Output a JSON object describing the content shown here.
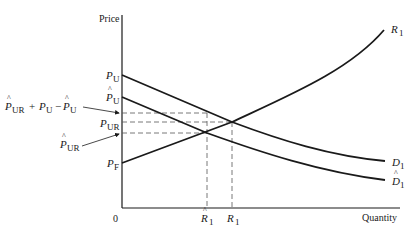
{
  "diagram": {
    "axes": {
      "y_label": "Price",
      "x_label": "Quantity",
      "origin_label": "0"
    },
    "price_labels": {
      "p_u": {
        "main": "P",
        "sub": "U",
        "hat": false
      },
      "p_u_hat": {
        "main": "P",
        "sub": "U",
        "hat": true
      },
      "p_ur": {
        "main": "P",
        "sub": "UR",
        "hat": false
      },
      "p_f": {
        "main": "P",
        "sub": "F",
        "hat": false
      },
      "p_ur_hat_callout": {
        "main": "P",
        "sub": "UR",
        "hat": true
      },
      "combo_callout": {
        "t1_main": "P",
        "t1_sub": "UR",
        "t1_hat": true,
        "plus": "+",
        "t2_main": "P",
        "t2_sub": "U",
        "minus": "−",
        "t3_main": "P",
        "t3_sub": "U",
        "t3_hat": true
      }
    },
    "quantity_labels": {
      "r1_hat": {
        "main": "R",
        "sub": "1",
        "hat": true
      },
      "r1": {
        "main": "R",
        "sub": "1",
        "hat": false
      }
    },
    "curve_labels": {
      "supply": {
        "main": "R",
        "sub": "1"
      },
      "demand": {
        "main": "D",
        "sub": "1"
      },
      "demand_hat": {
        "main": "D",
        "sub": "1",
        "hat": true
      }
    },
    "hat_glyph": "^",
    "colors": {
      "line": "#1a1a1a",
      "dashed": "#555555",
      "background": "#ffffff"
    }
  }
}
